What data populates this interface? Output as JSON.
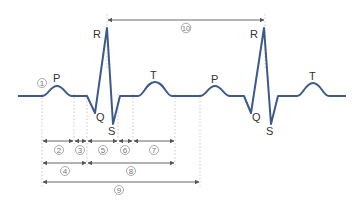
{
  "diagram": {
    "colors": {
      "waveform": "#3d5a8a",
      "arrow": "#555555",
      "guide": "#bbbbbb",
      "text": "#333333"
    },
    "wave_labels": {
      "p1": "P",
      "q1": "Q",
      "r1": "R",
      "s1": "S",
      "t1": "T",
      "p2": "P",
      "q2": "Q",
      "r2": "R",
      "s2": "S",
      "t2": "T"
    },
    "markers": {
      "m1": "1",
      "m2": "2",
      "m3": "3",
      "m4": "4",
      "m5": "5",
      "m6": "6",
      "m7": "7",
      "m8": "8",
      "m9": "9",
      "m10": "10"
    },
    "intervals": [
      {
        "id": "1",
        "label": "1",
        "meaning": "P wave marker"
      },
      {
        "id": "2",
        "label": "2",
        "from": "P start",
        "to": "P end"
      },
      {
        "id": "3",
        "label": "3",
        "from": "P end",
        "to": "QRS start"
      },
      {
        "id": "4",
        "label": "4",
        "from": "P start",
        "to": "QRS start"
      },
      {
        "id": "5",
        "label": "5",
        "from": "QRS start",
        "to": "QRS end"
      },
      {
        "id": "6",
        "label": "6",
        "from": "QRS end",
        "to": "T start"
      },
      {
        "id": "7",
        "label": "7",
        "from": "T start",
        "to": "T end"
      },
      {
        "id": "8",
        "label": "8",
        "from": "QRS start",
        "to": "T end"
      },
      {
        "id": "9",
        "label": "9",
        "from": "P start",
        "to": "next P start"
      },
      {
        "id": "10",
        "label": "10",
        "from": "R peak",
        "to": "next R peak"
      }
    ]
  }
}
